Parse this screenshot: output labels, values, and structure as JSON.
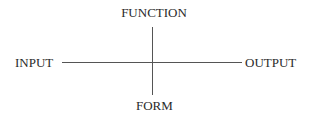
{
  "diagram": {
    "type": "cross-axes",
    "labels": {
      "top": "FUNCTION",
      "left": "INPUT",
      "right": "OUTPUT",
      "bottom": "FORM"
    }
  }
}
